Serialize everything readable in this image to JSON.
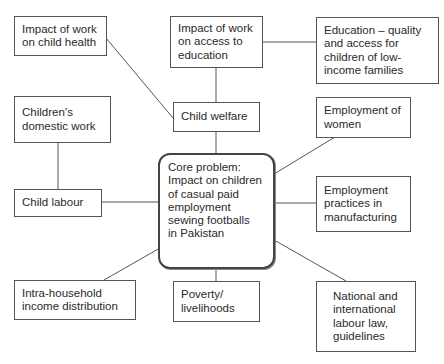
{
  "diagram": {
    "type": "problem-tree / mind map",
    "core": {
      "id": "core",
      "label": "Core problem:\nImpact on children\nof casual paid\nemployment\nsewing footballs\nin Pakistan"
    },
    "nodes": [
      {
        "id": "child-health",
        "label": "Impact of work\non child health"
      },
      {
        "id": "access-education",
        "label": "Impact of work\non access to\neducation"
      },
      {
        "id": "education-quality",
        "label": "Education – quality\nand access for\nchildren of low-\nincome families"
      },
      {
        "id": "domestic-work",
        "label": "Children’s\ndomestic work"
      },
      {
        "id": "child-welfare",
        "label": "Child welfare"
      },
      {
        "id": "employment-women",
        "label": "Employment of\nwomen"
      },
      {
        "id": "child-labour",
        "label": "Child labour"
      },
      {
        "id": "employment-practices",
        "label": "Employment\npractices in\nmanufacturing"
      },
      {
        "id": "intra-household",
        "label": "Intra-household\nincome distribution"
      },
      {
        "id": "poverty",
        "label": "Poverty/\nlivelihoods"
      },
      {
        "id": "labour-law",
        "label": "National and\ninternational\nlabour law,\nguidelines"
      }
    ],
    "edges": [
      [
        "child-health",
        "child-welfare"
      ],
      [
        "access-education",
        "child-welfare"
      ],
      [
        "access-education",
        "education-quality"
      ],
      [
        "child-welfare",
        "core"
      ],
      [
        "domestic-work",
        "child-labour"
      ],
      [
        "child-labour",
        "core"
      ],
      [
        "employment-women",
        "core"
      ],
      [
        "employment-practices",
        "core"
      ],
      [
        "intra-household",
        "core"
      ],
      [
        "poverty",
        "core"
      ],
      [
        "labour-law",
        "core"
      ]
    ],
    "colors": {
      "line": "#555555",
      "border": "#555555",
      "text": "#2a2a2a",
      "background": "#ffffff"
    }
  }
}
